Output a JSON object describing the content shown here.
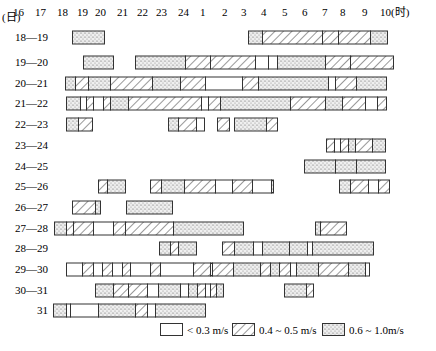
{
  "chart_data": {
    "type": "table",
    "title": "",
    "xlabel": "(时)",
    "ylabel": "(日)",
    "x_ticks": [
      "16",
      "17",
      "18",
      "19",
      "20",
      "21",
      "22",
      "23",
      "24",
      "1",
      "2",
      "3",
      "4",
      "5",
      "6",
      "7",
      "8",
      "9",
      "10(时)"
    ],
    "tick_x": [
      13,
      35,
      57,
      77,
      95,
      117,
      137,
      156,
      178,
      200,
      222,
      241,
      261,
      282,
      302,
      322,
      340,
      362,
      380
    ],
    "legend": [
      {
        "key": "low",
        "label": "< 0.3 m/s"
      },
      {
        "key": "mid",
        "label": "0.4 ~ 0.5 m/s"
      },
      {
        "key": "high",
        "label": "0.6 ~ 1.0m/s"
      }
    ],
    "rows": [
      {
        "label": "18—19",
        "y": 37,
        "segments": [
          [
            72,
            104,
            "high"
          ],
          [
            248,
            262,
            "high"
          ],
          [
            262,
            322,
            "mid"
          ],
          [
            322,
            338,
            "mid"
          ],
          [
            338,
            370,
            "mid"
          ],
          [
            370,
            387,
            "high"
          ]
        ]
      },
      {
        "label": "19—20",
        "y": 62,
        "segments": [
          [
            83,
            113,
            "high"
          ],
          [
            135,
            185,
            "high"
          ],
          [
            185,
            210,
            "mid"
          ],
          [
            210,
            255,
            "mid"
          ],
          [
            255,
            268,
            "low"
          ],
          [
            268,
            277,
            "low"
          ],
          [
            277,
            325,
            "high"
          ],
          [
            325,
            350,
            "mid"
          ],
          [
            350,
            393,
            "mid"
          ]
        ]
      },
      {
        "label": "20—21",
        "y": 83,
        "segments": [
          [
            65,
            75,
            "high"
          ],
          [
            75,
            88,
            "mid"
          ],
          [
            88,
            110,
            "high"
          ],
          [
            110,
            152,
            "mid"
          ],
          [
            152,
            180,
            "high"
          ],
          [
            180,
            205,
            "mid"
          ],
          [
            205,
            242,
            "low"
          ],
          [
            242,
            258,
            "mid"
          ],
          [
            258,
            328,
            "high"
          ],
          [
            328,
            335,
            "low"
          ],
          [
            335,
            356,
            "mid"
          ],
          [
            356,
            386,
            "high"
          ]
        ]
      },
      {
        "label": "21—22",
        "y": 103,
        "segments": [
          [
            66,
            80,
            "high"
          ],
          [
            80,
            86,
            "low"
          ],
          [
            86,
            93,
            "mid"
          ],
          [
            93,
            103,
            "low"
          ],
          [
            103,
            110,
            "mid"
          ],
          [
            110,
            128,
            "high"
          ],
          [
            128,
            201,
            "mid"
          ],
          [
            201,
            208,
            "low"
          ],
          [
            208,
            220,
            "mid"
          ],
          [
            220,
            290,
            "high"
          ],
          [
            290,
            325,
            "mid"
          ],
          [
            325,
            342,
            "high"
          ],
          [
            342,
            365,
            "mid"
          ],
          [
            365,
            377,
            "low"
          ],
          [
            377,
            386,
            "mid"
          ]
        ]
      },
      {
        "label": "22—23",
        "y": 124,
        "segments": [
          [
            66,
            78,
            "high"
          ],
          [
            78,
            92,
            "mid"
          ],
          [
            168,
            178,
            "high"
          ],
          [
            178,
            196,
            "mid"
          ],
          [
            196,
            204,
            "low"
          ],
          [
            217,
            229,
            "mid"
          ],
          [
            234,
            266,
            "high"
          ],
          [
            266,
            277,
            "mid"
          ]
        ]
      },
      {
        "label": "23—24",
        "y": 145,
        "segments": [
          [
            326,
            334,
            "mid"
          ],
          [
            334,
            340,
            "low"
          ],
          [
            340,
            348,
            "mid"
          ],
          [
            348,
            355,
            "high"
          ],
          [
            355,
            372,
            "mid"
          ],
          [
            372,
            385,
            "high"
          ]
        ]
      },
      {
        "label": "24—25",
        "y": 166,
        "segments": [
          [
            304,
            335,
            "high"
          ],
          [
            335,
            356,
            "high"
          ],
          [
            356,
            385,
            "high"
          ]
        ]
      },
      {
        "label": "25—26",
        "y": 186,
        "segments": [
          [
            98,
            107,
            "mid"
          ],
          [
            107,
            125,
            "high"
          ],
          [
            150,
            161,
            "mid"
          ],
          [
            161,
            184,
            "high"
          ],
          [
            184,
            215,
            "mid"
          ],
          [
            215,
            232,
            "low"
          ],
          [
            232,
            252,
            "mid"
          ],
          [
            252,
            271,
            "low"
          ],
          [
            271,
            273,
            "high"
          ],
          [
            339,
            350,
            "high"
          ],
          [
            350,
            368,
            "mid"
          ],
          [
            368,
            378,
            "low"
          ],
          [
            378,
            389,
            "mid"
          ]
        ]
      },
      {
        "label": "26—27",
        "y": 207,
        "segments": [
          [
            72,
            95,
            "mid"
          ],
          [
            95,
            100,
            "high"
          ],
          [
            126,
            172,
            "high"
          ]
        ]
      },
      {
        "label": "27—28",
        "y": 228,
        "segments": [
          [
            54,
            66,
            "high"
          ],
          [
            66,
            73,
            "mid"
          ],
          [
            73,
            93,
            "mid"
          ],
          [
            93,
            113,
            "low"
          ],
          [
            113,
            125,
            "mid"
          ],
          [
            125,
            173,
            "mid"
          ],
          [
            173,
            243,
            "high"
          ],
          [
            315,
            320,
            "high"
          ],
          [
            320,
            346,
            "mid"
          ]
        ]
      },
      {
        "label": "28—29",
        "y": 248,
        "segments": [
          [
            159,
            170,
            "high"
          ],
          [
            170,
            178,
            "mid"
          ],
          [
            178,
            196,
            "high"
          ],
          [
            222,
            234,
            "mid"
          ],
          [
            234,
            253,
            "high"
          ],
          [
            253,
            262,
            "low"
          ],
          [
            262,
            289,
            "high"
          ],
          [
            289,
            307,
            "high"
          ],
          [
            307,
            312,
            "low"
          ],
          [
            312,
            373,
            "high"
          ]
        ]
      },
      {
        "label": "29—30",
        "y": 269,
        "segments": [
          [
            66,
            82,
            "low"
          ],
          [
            82,
            93,
            "mid"
          ],
          [
            93,
            102,
            "low"
          ],
          [
            102,
            112,
            "mid"
          ],
          [
            112,
            122,
            "low"
          ],
          [
            122,
            130,
            "mid"
          ],
          [
            130,
            150,
            "low"
          ],
          [
            150,
            160,
            "mid"
          ],
          [
            160,
            193,
            "low"
          ],
          [
            193,
            210,
            "mid"
          ],
          [
            210,
            212,
            "low"
          ],
          [
            212,
            233,
            "mid"
          ],
          [
            233,
            260,
            "high"
          ],
          [
            260,
            270,
            "mid"
          ],
          [
            270,
            279,
            "high"
          ],
          [
            279,
            290,
            "mid"
          ],
          [
            290,
            296,
            "low"
          ],
          [
            296,
            318,
            "high"
          ],
          [
            318,
            348,
            "mid"
          ],
          [
            348,
            365,
            "high"
          ],
          [
            365,
            369,
            "low"
          ]
        ]
      },
      {
        "label": "30—31",
        "y": 290,
        "segments": [
          [
            95,
            113,
            "high"
          ],
          [
            113,
            128,
            "mid"
          ],
          [
            128,
            147,
            "mid"
          ],
          [
            147,
            158,
            "low"
          ],
          [
            158,
            180,
            "high"
          ],
          [
            180,
            188,
            "low"
          ],
          [
            188,
            197,
            "high"
          ],
          [
            197,
            205,
            "mid"
          ],
          [
            205,
            210,
            "low"
          ],
          [
            210,
            216,
            "mid"
          ],
          [
            216,
            223,
            "high"
          ],
          [
            284,
            306,
            "high"
          ],
          [
            306,
            313,
            "mid"
          ]
        ]
      },
      {
        "label": "31",
        "y": 310,
        "segments": [
          [
            53,
            66,
            "high"
          ],
          [
            66,
            70,
            "low"
          ],
          [
            70,
            98,
            "low"
          ],
          [
            98,
            135,
            "high"
          ],
          [
            135,
            147,
            "mid"
          ],
          [
            147,
            155,
            "low"
          ],
          [
            155,
            205,
            "high"
          ]
        ]
      }
    ],
    "bar_height": 13,
    "row_label_x": 48
  },
  "header": {
    "unit_left": "(日)"
  },
  "colors": {
    "stroke": "#333333",
    "fill": "#ffffff",
    "dots": "#555555"
  }
}
